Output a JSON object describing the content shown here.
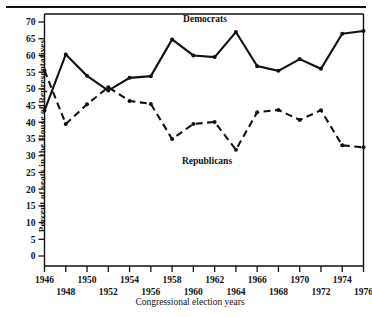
{
  "figure": {
    "top_rule": "horizontal-rule",
    "xlabel": "Congressional election years",
    "ylabel": "Percent of seats in the House of Representatives"
  },
  "axes": {
    "y_ticks": [
      "0",
      "5",
      "10",
      "15",
      "20",
      "25",
      "30",
      "35",
      "40",
      "45",
      "50",
      "55",
      "60",
      "65",
      "70"
    ],
    "x_ticks": [
      "1946",
      "1948",
      "1950",
      "1952",
      "1954",
      "1956",
      "1958",
      "1960",
      "1962",
      "1964",
      "1966",
      "1968",
      "1970",
      "1972",
      "1974",
      "1976"
    ]
  },
  "annotations": {
    "democrats_label": "Democrats",
    "republicans_label": "Republicans"
  },
  "chart_data": {
    "type": "line",
    "title": "",
    "xlabel": "Congressional election years",
    "ylabel": "Percent of seats in the House of Representatives",
    "xlim": [
      1945,
      1977
    ],
    "ylim": [
      0,
      72
    ],
    "ytick_step": 5,
    "grid": false,
    "legend": "inline-annotations",
    "x": [
      1946,
      1948,
      1950,
      1952,
      1954,
      1956,
      1958,
      1960,
      1962,
      1964,
      1966,
      1968,
      1970,
      1972,
      1974,
      1976
    ],
    "series": [
      {
        "name": "Democrats",
        "style": "solid",
        "color": "#111111",
        "values": [
          43.5,
          60.3,
          53.9,
          49.5,
          53.3,
          53.8,
          64.8,
          60.0,
          59.5,
          67.0,
          56.8,
          55.4,
          58.9,
          56.0,
          66.5,
          67.3
        ]
      },
      {
        "name": "Republicans",
        "style": "dashed",
        "color": "#111111",
        "values": [
          55.5,
          39.5,
          45.4,
          50.5,
          46.4,
          45.5,
          35.0,
          39.5,
          40.1,
          31.8,
          43.0,
          43.7,
          40.7,
          43.6,
          33.1,
          32.5
        ]
      }
    ]
  }
}
